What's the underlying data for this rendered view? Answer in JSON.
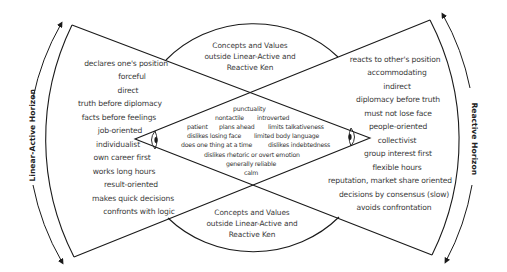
{
  "diagram": {
    "colors": {
      "stroke": "#1a1a1a",
      "text": "#3a3a3a",
      "background": "#ffffff"
    },
    "horizons": {
      "left": {
        "label": "Linear-Active Horizon"
      },
      "right": {
        "label": "Reactive Horizon"
      }
    },
    "concepts_outside": {
      "top": {
        "line1": "Concepts and Values",
        "line2": "outside Linear-Active and",
        "line3": "Reactive Ken"
      },
      "bottom": {
        "line1": "Concepts and Values",
        "line2": "outside Linear-Active and",
        "line3": "Reactive Ken"
      }
    },
    "linear_active_traits": [
      "declares one's position",
      "forceful",
      "direct",
      "truth before diplomacy",
      "facts before feelings",
      "job-oriented",
      "individualist",
      "own career first",
      "works long hours",
      "result-oriented",
      "makes quick decisions",
      "confronts with logic"
    ],
    "reactive_traits": [
      "reacts to other's position",
      "accommodating",
      "indirect",
      "diplomacy before truth",
      "must not lose face",
      "people-oriented",
      "collectivist",
      "group interest first",
      "flexible hours",
      "reputation, market share oriented",
      "decisions by consensus (slow)",
      "avoids confrontation"
    ],
    "shared_traits": {
      "punctuality": "punctuality",
      "nontactile": "nontactile",
      "introverted": "introverted",
      "patient": "patient",
      "plans_ahead": "plans ahead",
      "limits_talkativeness": "limits talkativeness",
      "dislikes_losing_face": "dislikes losing face",
      "limited_body_language": "limited body language",
      "does_one_thing": "does one thing at a time",
      "dislikes_indebtedness": "dislikes indebtedness",
      "dislikes_rhetoric": "dislikes rhetoric or overt emotion",
      "generally_reliable": "generally reliable",
      "calm": "calm"
    },
    "icons": {
      "left_eye": "eye-icon",
      "right_eye": "eye-icon"
    }
  }
}
